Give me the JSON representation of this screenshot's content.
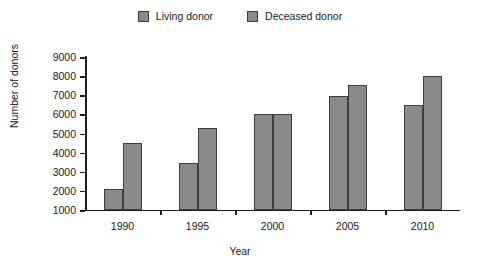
{
  "chart_data": {
    "type": "bar",
    "title": "",
    "xlabel": "Year",
    "ylabel": "Number of donors",
    "categories": [
      "1990",
      "1995",
      "2000",
      "2005",
      "2010"
    ],
    "series": [
      {
        "name": "Living donor",
        "values": [
          2100,
          3450,
          6000,
          6950,
          6500
        ]
      },
      {
        "name": "Deceased donor",
        "values": [
          4500,
          5300,
          6000,
          7550,
          8000
        ]
      }
    ],
    "ylim": [
      1000,
      9000
    ],
    "yticks": [
      1000,
      2000,
      3000,
      4000,
      5000,
      6000,
      7000,
      8000,
      9000
    ],
    "ytick_labels": [
      "1000",
      "2000",
      "3000",
      "4000",
      "5000",
      "6000",
      "7000",
      "8000",
      "9000"
    ],
    "grid": false,
    "legend_position": "top-center",
    "bar_fill_color": "#8a8a8a",
    "bar_edge_color": "#3f3f3f",
    "axis_color": "#1f1f1f"
  },
  "legend": {
    "entries": [
      {
        "label": "Living donor",
        "swatch": "legend-swatch-living"
      },
      {
        "label": "Deceased donor",
        "swatch": "legend-swatch-deceased"
      }
    ]
  }
}
